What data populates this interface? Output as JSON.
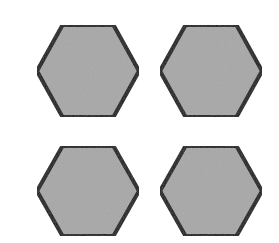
{
  "diagram": {
    "title": "",
    "width": 279,
    "height": 243,
    "background": "#ffffff",
    "style": {
      "fill": "#a8a8a8",
      "stroke": "#1a1a1a",
      "stroke_width": 4
    },
    "shapes": [
      {
        "id": "hex-top-left",
        "type": "hexagon",
        "cx": 88,
        "cy": 71,
        "rx": 51,
        "ry": 46
      },
      {
        "id": "hex-top-right",
        "type": "hexagon",
        "cx": 211,
        "cy": 71,
        "rx": 51,
        "ry": 46
      },
      {
        "id": "hex-bottom-left",
        "type": "hexagon",
        "cx": 88,
        "cy": 191,
        "rx": 51,
        "ry": 45
      },
      {
        "id": "hex-bottom-right",
        "type": "hexagon",
        "cx": 211,
        "cy": 191,
        "rx": 51,
        "ry": 45
      }
    ]
  }
}
